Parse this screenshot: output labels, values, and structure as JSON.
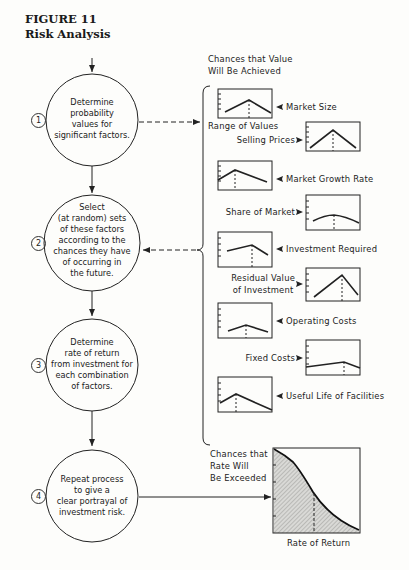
{
  "figure": {
    "number": "FIGURE 11",
    "title": "Risk Analysis"
  },
  "steps": [
    {
      "num": "1",
      "text": [
        "Determine",
        "probability",
        "values for",
        "significant factors."
      ]
    },
    {
      "num": "2",
      "text": [
        "Select",
        "(at random) sets",
        "of these factors",
        "according to the",
        "chances they have",
        "of occurring in",
        "the future."
      ]
    },
    {
      "num": "3",
      "text": [
        "Determine",
        "rate of return",
        "from investment for",
        "each combination",
        "of factors."
      ]
    },
    {
      "num": "4",
      "text": [
        "Repeat process",
        "to give a",
        "clear portrayal of",
        "investment risk."
      ]
    }
  ],
  "factors_header": [
    "Chances that Value",
    "Will Be Achieved"
  ],
  "range_label": "Range of Values",
  "factors": [
    {
      "label": "Market Size",
      "side": "left"
    },
    {
      "label": "Selling Prices",
      "side": "right"
    },
    {
      "label": "Market Growth Rate",
      "side": "left"
    },
    {
      "label": "Share of Market",
      "side": "right"
    },
    {
      "label": "Investment Required",
      "side": "left"
    },
    {
      "label": "Residual Value of Investment",
      "line1": "Residual Value",
      "line2": "of Investment",
      "side": "right"
    },
    {
      "label": "Operating Costs",
      "side": "left"
    },
    {
      "label": "Fixed Costs",
      "side": "right"
    },
    {
      "label": "Useful Life of Facilities",
      "side": "left"
    }
  ],
  "result_chart": {
    "ylabel": [
      "Chances that",
      "Rate Will",
      "Be Exceeded"
    ],
    "xlabel": "Rate of Return"
  },
  "chart_data": {
    "type": "area",
    "xlabel": "Rate of Return",
    "ylabel": "Chances that Rate Will Be Exceeded",
    "x": [
      0,
      0.1,
      0.25,
      0.5,
      0.75,
      1.0
    ],
    "values": [
      1.0,
      0.95,
      0.85,
      0.5,
      0.2,
      0.05
    ],
    "grid": false
  }
}
